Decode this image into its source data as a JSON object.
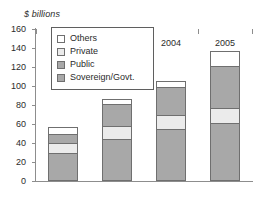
{
  "chart_data": {
    "type": "bar",
    "stacked": true,
    "title": "",
    "ylabel": "$ billions",
    "xlabel": "",
    "categories": [
      "2002",
      "2003",
      "2004",
      "2005"
    ],
    "ylim": [
      0,
      160
    ],
    "yticks": [
      0,
      20,
      40,
      60,
      80,
      100,
      120,
      140,
      160
    ],
    "grid": false,
    "legend_position": "upper-left-inset",
    "series": [
      {
        "name": "Sovereign/Govt.",
        "color": "#a8a8a8",
        "values": [
          29,
          44,
          55,
          61
        ]
      },
      {
        "name": "Private",
        "color": "#ebebeb",
        "values": [
          11,
          14,
          14,
          16
        ]
      },
      {
        "name": "Public",
        "color": "#a8a8a8",
        "values": [
          10,
          23,
          30,
          44
        ]
      },
      {
        "name": "Others",
        "color": "#ffffff",
        "values": [
          7,
          5,
          6,
          16
        ]
      }
    ],
    "totals": [
      57,
      86,
      105,
      137
    ]
  },
  "legend": {
    "items": [
      {
        "label": "Others",
        "color": "#ffffff"
      },
      {
        "label": "Private",
        "color": "#ebebeb"
      },
      {
        "label": "Public",
        "color": "#a8a8a8"
      },
      {
        "label": "Sovereign/Govt.",
        "color": "#a8a8a8"
      }
    ]
  }
}
